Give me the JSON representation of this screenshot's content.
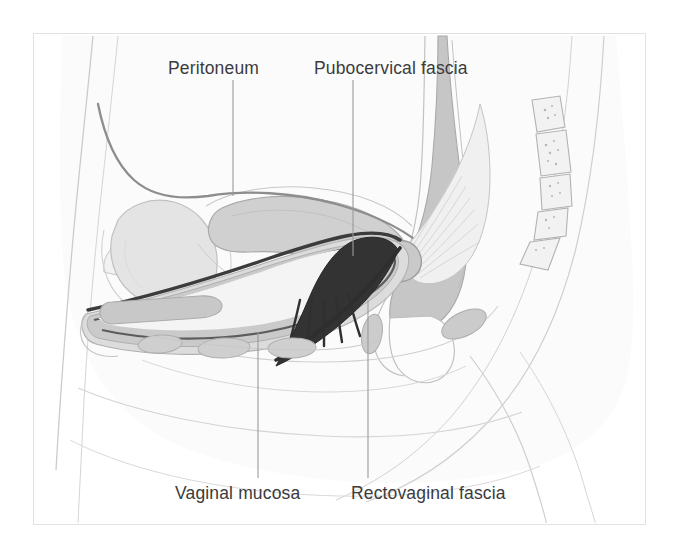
{
  "figure": {
    "domain": "medical-illustration",
    "background_color": "#ffffff",
    "frame_color": "#e2e2e2",
    "label_color": "#3b3b3b",
    "leader_line_color": "#9a9a9a"
  },
  "labels": [
    {
      "id": "peritoneum",
      "text": "Peritoneum",
      "position": "top-left",
      "leader": {
        "x": 233,
        "y_start": 80,
        "y_end": 196
      }
    },
    {
      "id": "pubocervical-fascia",
      "text": "Pubocervical fascia",
      "position": "top-right",
      "leader": {
        "x": 353,
        "y_start": 80,
        "y_end": 256
      }
    },
    {
      "id": "vaginal-mucosa",
      "text": "Vaginal mucosa",
      "position": "bottom-left",
      "leader": {
        "x": 258,
        "y_start": 332,
        "y_end": 478
      }
    },
    {
      "id": "rectovaginal-fascia",
      "text": "Rectovaginal fascia",
      "position": "bottom-right",
      "leader": {
        "x": 368,
        "y_start": 300,
        "y_end": 478
      }
    }
  ],
  "structures": [
    {
      "id": "body-outline",
      "name": "Body outline / skin contour",
      "fill": "#fdfdfd",
      "stroke": "#c9c9c9"
    },
    {
      "id": "soft-tissue",
      "name": "Subcutaneous soft tissue",
      "fill": "#f6f6f6",
      "stroke": "#d2d2d2"
    },
    {
      "id": "bladder",
      "name": "Urinary bladder",
      "fill": "#e3e3e3",
      "stroke": "#bdbdbd"
    },
    {
      "id": "uterus",
      "name": "Uterus",
      "fill": "#cfcfcf",
      "stroke": "#a8a8a8"
    },
    {
      "id": "peritoneum-line",
      "name": "Peritoneum",
      "fill": "none",
      "stroke": "#8a8a8a"
    },
    {
      "id": "urethra",
      "name": "Urethra",
      "fill": "#c6c6c6",
      "stroke": "#ababab"
    },
    {
      "id": "vaginal-lumen",
      "name": "Vaginal lumen",
      "fill": "#ffffff",
      "stroke": "#777777"
    },
    {
      "id": "vaginal-mucosa-band",
      "name": "Vaginal mucosa",
      "fill": "#3a3a3a",
      "stroke": "#2c2c2c"
    },
    {
      "id": "pubocervical-fan",
      "name": "Pubocervical fascia fan",
      "fill": "#efefef",
      "stroke": "#bcbcbc"
    },
    {
      "id": "rectovaginal-band",
      "name": "Rectovaginal fascia",
      "fill": "#2e2e2e",
      "stroke": "#222222"
    },
    {
      "id": "rectum",
      "name": "Rectum",
      "fill": "#c4c4c4",
      "stroke": "#a5a5a5"
    },
    {
      "id": "anal-canal",
      "name": "Anal canal",
      "fill": "#fbfbfb",
      "stroke": "#b8b8b8"
    },
    {
      "id": "perineal-muscles",
      "name": "Perineal body muscles",
      "fill": "#cdcdcd",
      "stroke": "#aeaeae"
    },
    {
      "id": "sacrum-coccyx",
      "name": "Sacrum and coccyx vertebrae",
      "fill": "#f0f0f0",
      "stroke": "#b0b0b0",
      "segment_count": 5
    },
    {
      "id": "pubic-bone",
      "name": "Pubic symphysis region",
      "fill": "#ededed",
      "stroke": "#c0c0c0"
    }
  ]
}
